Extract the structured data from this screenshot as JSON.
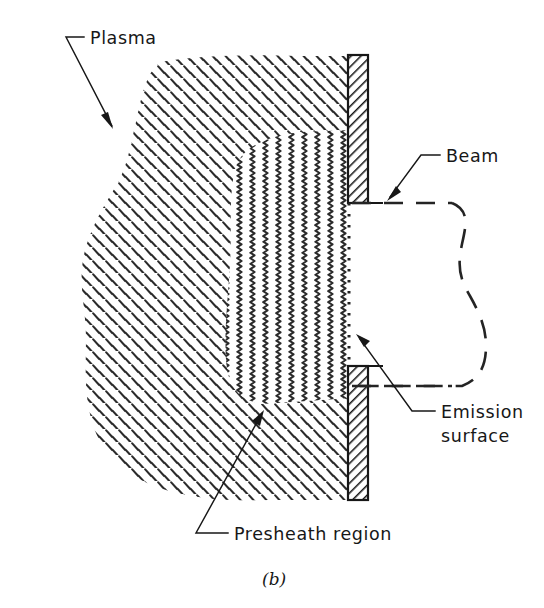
{
  "figure": {
    "caption": "(b)",
    "domain_kind": "schematic-diagram",
    "background_color": "#ffffff",
    "ink_color": "#171717"
  },
  "labels": {
    "plasma": "Plasma",
    "beam": "Beam",
    "emission_surface_line1": "Emission",
    "emission_surface_line2": "surface",
    "presheath": "Presheath  region"
  },
  "regions": [
    {
      "id": "plasma-bulk",
      "name": "Plasma",
      "fill_pattern": "short-diagonal-dashes",
      "pattern_angle_deg": 45,
      "description": "Irregular rounded blob of short backslash dashes occupying the left and centre of the frame"
    },
    {
      "id": "presheath",
      "name": "Presheath region",
      "fill_pattern": "vertical-zigzag-waves",
      "description": "Band of vertical wavy lines adjacent to the emission surface, widening from top to bottom"
    },
    {
      "id": "beam",
      "name": "Beam",
      "fill_pattern": "none",
      "boundary_style": "dashed",
      "description": "Unhatched region to the right of the emission surface bounded by dashed lines"
    }
  ],
  "elements": [
    {
      "id": "electrode-upper",
      "name": "Upper extraction electrode",
      "fill_pattern": "45-degree-hatch",
      "x": 348,
      "y": 55,
      "width": 20,
      "height": 148
    },
    {
      "id": "electrode-lower",
      "name": "Lower extraction electrode",
      "fill_pattern": "45-degree-hatch",
      "x": 348,
      "y": 366,
      "width": 20,
      "height": 134
    },
    {
      "id": "emission-surface",
      "name": "Emission surface",
      "style": "dotted-vertical-line",
      "x": 349,
      "y_start": 203,
      "y_end": 367
    }
  ],
  "leaders": [
    {
      "id": "plasma-leader",
      "label": "Plasma",
      "tick_from": [
        66,
        37
      ],
      "tick_to": [
        84,
        37
      ],
      "line_to": [
        113,
        128
      ],
      "arrow": true
    },
    {
      "id": "beam-leader",
      "label": "Beam",
      "tick_from": [
        440,
        155
      ],
      "tick_to": [
        421,
        155
      ],
      "line_to": [
        388,
        199
      ],
      "arrow": true
    },
    {
      "id": "emission-leader",
      "label": "Emission surface",
      "tick_from": [
        435,
        411
      ],
      "tick_to": [
        412,
        411
      ],
      "line_to": [
        357,
        336
      ],
      "arrow": true
    },
    {
      "id": "presheath-leader",
      "label": "Presheath region",
      "tick_from": [
        196,
        533
      ],
      "tick_to": [
        228,
        533
      ],
      "line_to": [
        264,
        412
      ],
      "arrow": true
    }
  ]
}
